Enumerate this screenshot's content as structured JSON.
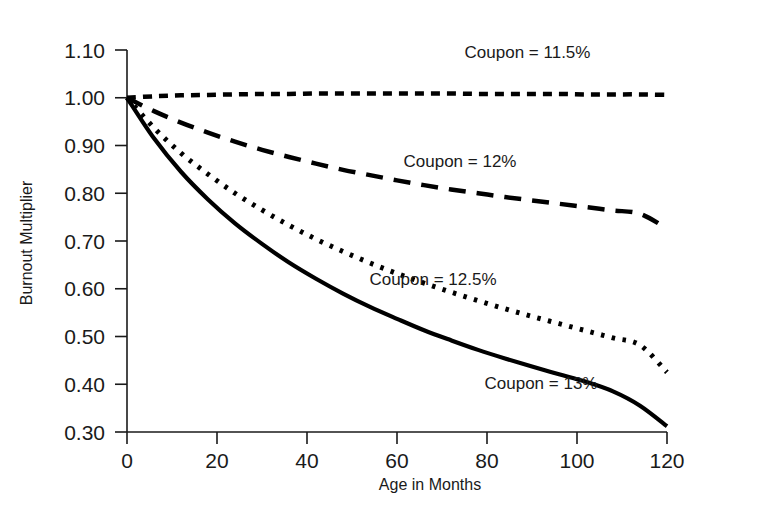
{
  "chart_data": {
    "type": "line",
    "title": "",
    "xlabel": "Age in Months",
    "ylabel": "Burnout Multiplier",
    "xlim": [
      0,
      120
    ],
    "ylim": [
      0.3,
      1.1
    ],
    "grid": false,
    "legend_position": "inline-annotations",
    "x_ticks": [
      "0",
      "20",
      "40",
      "60",
      "80",
      "100",
      "120"
    ],
    "x_tick_values": [
      0,
      20,
      40,
      60,
      80,
      100,
      120
    ],
    "y_ticks": [
      "0.30",
      "0.40",
      "0.50",
      "0.60",
      "0.70",
      "0.80",
      "0.90",
      "1.00",
      "1.10"
    ],
    "y_tick_values": [
      0.3,
      0.4,
      0.5,
      0.6,
      0.7,
      0.8,
      0.9,
      1.0,
      1.1
    ],
    "x": [
      0,
      6,
      12,
      18,
      24,
      30,
      36,
      42,
      48,
      54,
      60,
      66,
      72,
      78,
      84,
      90,
      96,
      102,
      108,
      114,
      120
    ],
    "series": [
      {
        "name": "Coupon = 11.5%",
        "label": "Coupon = 11.5%",
        "style": "dashed-short",
        "dasharray": "9,7",
        "width": 4.5,
        "color": "#000000",
        "values": [
          1.0,
          1.003,
          1.005,
          1.006,
          1.007,
          1.008,
          1.008,
          1.009,
          1.009,
          1.009,
          1.009,
          1.009,
          1.009,
          1.008,
          1.008,
          1.008,
          1.008,
          1.007,
          1.007,
          1.007,
          1.006
        ],
        "label_x": 89,
        "label_y": 1.083
      },
      {
        "name": "Coupon = 12%",
        "label": "Coupon = 12%",
        "style": "dashed-long",
        "dasharray": "17,11",
        "width": 4.5,
        "color": "#000000",
        "values": [
          1.0,
          0.972,
          0.948,
          0.927,
          0.908,
          0.891,
          0.876,
          0.862,
          0.849,
          0.838,
          0.827,
          0.817,
          0.808,
          0.8,
          0.792,
          0.785,
          0.778,
          0.771,
          0.764,
          0.757,
          0.726
        ],
        "label_x": 74,
        "label_y": 0.855
      },
      {
        "name": "Coupon = 12.5%",
        "label": "Coupon = 12.5%",
        "style": "dotted",
        "dasharray": "3.5,7.5",
        "width": 5.0,
        "color": "#000000",
        "values": [
          1.0,
          0.937,
          0.884,
          0.84,
          0.8,
          0.765,
          0.733,
          0.704,
          0.678,
          0.654,
          0.632,
          0.612,
          0.593,
          0.575,
          0.558,
          0.542,
          0.527,
          0.512,
          0.497,
          0.482,
          0.425
        ],
        "label_x": 68,
        "label_y": 0.608
      },
      {
        "name": "Coupon = 13%",
        "label": "Coupon = 13%",
        "style": "solid",
        "dasharray": "",
        "width": 4.2,
        "color": "#000000",
        "values": [
          1.0,
          0.915,
          0.845,
          0.787,
          0.737,
          0.694,
          0.655,
          0.621,
          0.59,
          0.562,
          0.537,
          0.513,
          0.492,
          0.472,
          0.454,
          0.437,
          0.421,
          0.405,
          0.385,
          0.355,
          0.312
        ],
        "label_x": 92,
        "label_y": 0.39
      }
    ]
  },
  "axes": {
    "x_axis_name": "age-in-months-axis",
    "y_axis_name": "burnout-multiplier-axis"
  }
}
